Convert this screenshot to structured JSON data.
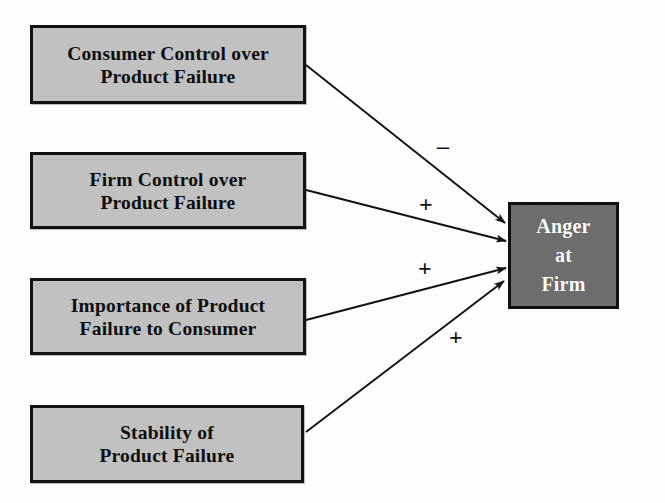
{
  "diagram": {
    "background_color": "#fdfdfd",
    "antecedent_fill": "#c2c2c2",
    "outcome_fill": "#6e6e6e",
    "border_color": "#121212",
    "outcome_text_color": "#ffffff"
  },
  "nodes": {
    "consumer_control": {
      "label": "Consumer Control over\nProduct Failure",
      "x": 30,
      "y": 25,
      "width": 276,
      "height": 79
    },
    "firm_control": {
      "label": "Firm Control over\nProduct Failure",
      "x": 30,
      "y": 152,
      "width": 276,
      "height": 77
    },
    "importance": {
      "label": "Importance of Product\nFailure to Consumer",
      "x": 30,
      "y": 278,
      "width": 276,
      "height": 77
    },
    "stability": {
      "label": "Stability of\nProduct Failure",
      "x": 30,
      "y": 405,
      "width": 274,
      "height": 78
    },
    "anger_at_firm": {
      "label": "Anger\nat\nFirm",
      "x": 508,
      "y": 202,
      "width": 111,
      "height": 107
    }
  },
  "links": [
    {
      "id": "consumer-control-to-anger",
      "from": "consumer_control",
      "to": "anger_at_firm",
      "sign": "–",
      "sign_x": 437,
      "sign_y": 134,
      "x1": 306,
      "y1": 65,
      "x2": 505,
      "y2": 223
    },
    {
      "id": "firm-control-to-anger",
      "from": "firm_control",
      "to": "anger_at_firm",
      "sign": "+",
      "sign_x": 419,
      "sign_y": 192,
      "x1": 306,
      "y1": 190,
      "x2": 506,
      "y2": 241
    },
    {
      "id": "importance-to-anger",
      "from": "importance",
      "to": "anger_at_firm",
      "sign": "+",
      "sign_x": 418,
      "sign_y": 256,
      "x1": 306,
      "y1": 320,
      "x2": 506,
      "y2": 268
    },
    {
      "id": "stability-to-anger",
      "from": "stability",
      "to": "anger_at_firm",
      "sign": "+",
      "sign_x": 449,
      "sign_y": 325,
      "x1": 306,
      "y1": 432,
      "x2": 504,
      "y2": 281
    }
  ]
}
